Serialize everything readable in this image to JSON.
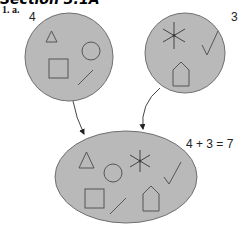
{
  "heading": "Section 3.1A",
  "question_label": "1. a.",
  "set_a": {
    "count": "4",
    "shapes": [
      "triangle",
      "circle",
      "square",
      "line"
    ]
  },
  "set_b": {
    "count": "3",
    "shapes": [
      "asterisk",
      "checkmark",
      "pentagon"
    ]
  },
  "union": {
    "shapes": [
      "triangle",
      "circle",
      "asterisk",
      "checkmark",
      "square",
      "line",
      "pentagon"
    ]
  },
  "equation": "4 + 3 = 7",
  "colors": {
    "fill": "#b9b9b9",
    "stroke": "#6f6f6f",
    "shape": "#555555"
  }
}
